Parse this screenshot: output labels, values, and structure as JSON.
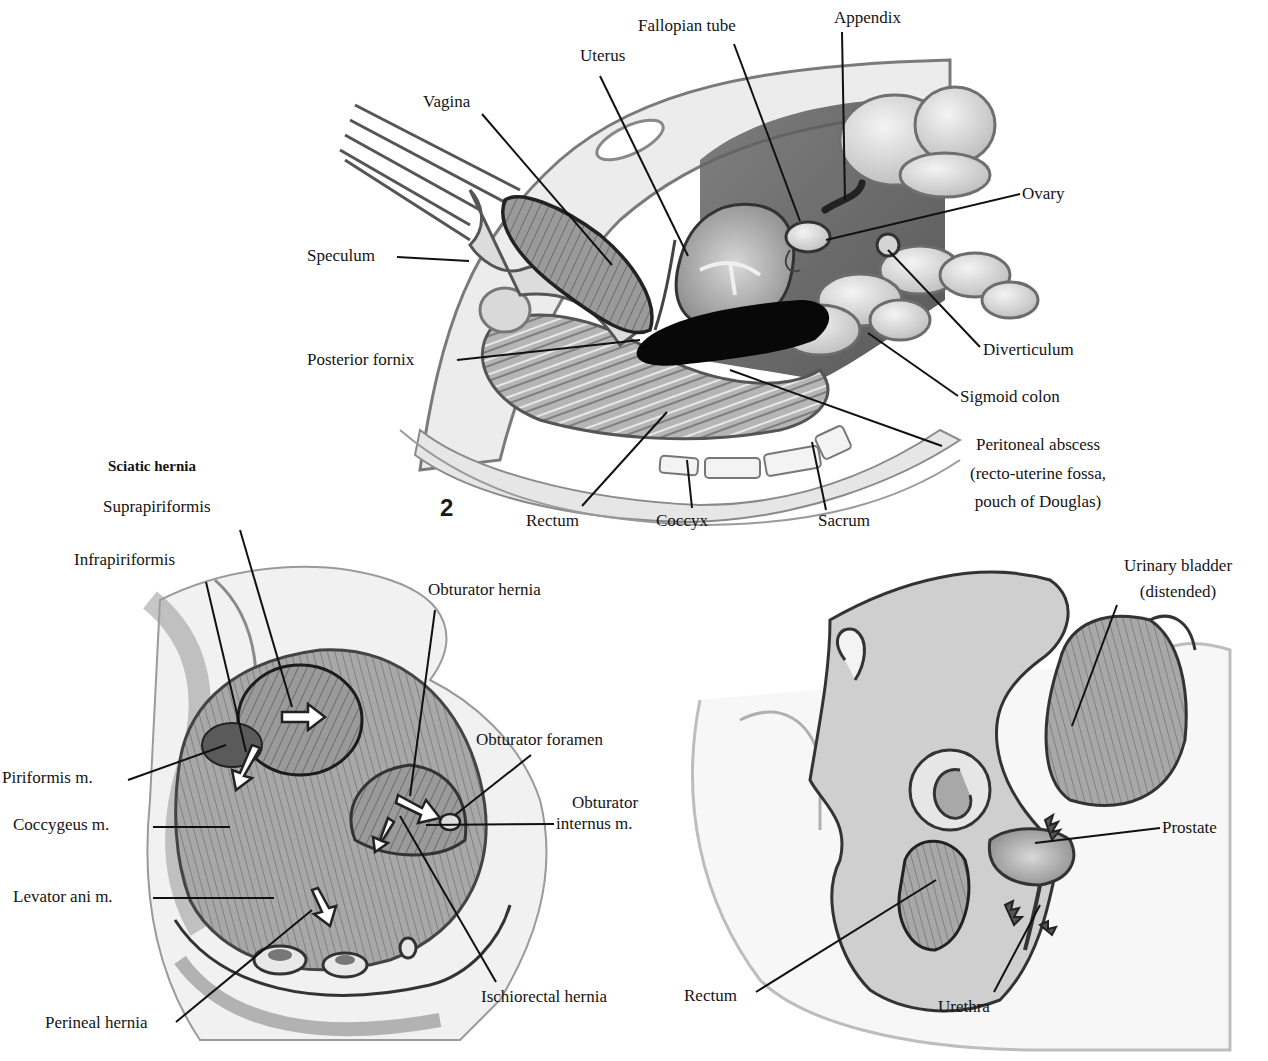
{
  "figures": [
    {
      "number": "2",
      "title": "",
      "labels": {
        "uterus": "Uterus",
        "fallopian_tube": "Fallopian tube",
        "appendix": "Appendix",
        "vagina": "Vagina",
        "ovary": "Ovary",
        "speculum": "Speculum",
        "diverticulum": "Diverticulum",
        "posterior_fornix": "Posterior fornix",
        "sigmoid_colon": "Sigmoid colon",
        "peritoneal_abscess": [
          "Peritoneal abscess",
          "(recto-uterine fossa,",
          "pouch of Douglas)"
        ],
        "rectum": "Rectum",
        "coccyx": "Coccyx",
        "sacrum": "Sacrum"
      }
    },
    {
      "number": "",
      "title": "Sciatic hernia",
      "labels": {
        "suprapiriformis": "Suprapiriformis",
        "infrapiriformis": "Infrapiriformis",
        "obturator_hernia": "Obturator hernia",
        "obturator_foramen": "Obturator foramen",
        "piriformis": "Piriformis m.",
        "obturator_internus": [
          "Obturator",
          "internus m."
        ],
        "coccygeus": "Coccygeus m.",
        "levator_ani": "Levator ani m.",
        "ischiorectal_hernia": "Ischiorectal hernia",
        "perineal_hernia": "Perineal hernia"
      }
    },
    {
      "number": "",
      "title": "",
      "labels": {
        "urinary_bladder": [
          "Urinary bladder",
          "(distended)"
        ],
        "prostate": "Prostate",
        "rectum": "Rectum",
        "urethra": "Urethra"
      }
    }
  ]
}
